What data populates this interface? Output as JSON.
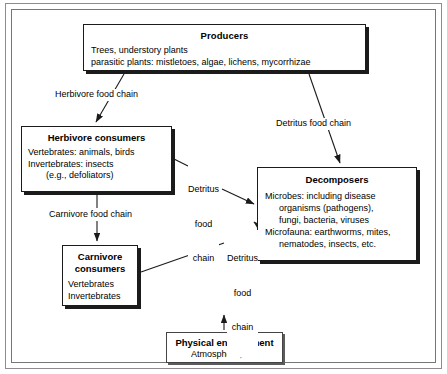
{
  "diagram": {
    "title_visible": false,
    "frame": {
      "style": "double-rule border"
    },
    "nodes": [
      {
        "id": "producers",
        "title": "Producers",
        "lines": [
          "Trees, understory plants",
          "parasitic plants: mistletoes, algae, lichens, mycorrhizae"
        ]
      },
      {
        "id": "herbivore",
        "title": "Herbivore consumers",
        "lines": [
          "Vertebrates: animals, birds",
          "Invertebrates: insects",
          "(e.g., defoliators)"
        ]
      },
      {
        "id": "decomposers",
        "title": "Decomposers",
        "lines": [
          "Microbes: including disease",
          "organisms (pathogens),",
          "fungi, bacteria, viruses",
          "Microfauna: earthworms, mites,",
          "nematodes, insects, etc."
        ]
      },
      {
        "id": "carnivore",
        "title_line_1": "Carnivore",
        "title_line_2": "consumers",
        "lines": [
          "Vertebrates",
          "Invertebrates"
        ]
      },
      {
        "id": "physical",
        "title": "Physical environment",
        "lines": [
          "Atmosphere, soil"
        ]
      }
    ],
    "edge_labels": {
      "herbivore_food_chain": "Herbivore food chain",
      "carnivore_food_chain": "Carnivore food chain",
      "detritus_food_chain_top": "Detritus food chain",
      "detritus_food_chain_mid_line1": "Detritus",
      "detritus_food_chain_mid_line2": "food",
      "detritus_food_chain_mid_line3": "chain",
      "detritus_food_chain_low_line1": "Detritus",
      "detritus_food_chain_low_line2": "food",
      "detritus_food_chain_low_line3": "chain"
    },
    "colors": {
      "line": "#1b1b1b",
      "frame": "#8c8c8c",
      "background": "#ffffff",
      "text": "#000000"
    }
  }
}
